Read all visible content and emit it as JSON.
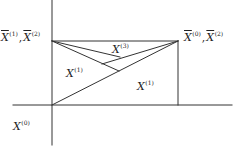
{
  "diagram": {
    "colors": {
      "line": "#333333",
      "text": "#222222",
      "background": "#ffffff"
    },
    "labels": {
      "top_left": {
        "a_base": "X",
        "a_sup": "(1)",
        "sep": ",",
        "b_base": "X",
        "b_sup": "(2)"
      },
      "top_right": {
        "a_base": "X",
        "a_sup": "(0)",
        "sep": ",",
        "b_base": "X",
        "b_sup": "(2)"
      },
      "region_top": {
        "base": "X",
        "sup": "(3)"
      },
      "region_left": {
        "base": "X",
        "sup": "(1)"
      },
      "region_right": {
        "base": "X",
        "sup": "(1)"
      },
      "bottom_left": {
        "base": "X",
        "sup": "(0)"
      }
    },
    "lines": {
      "vertical_axis": {
        "x1": 52,
        "y1": 0,
        "x2": 52,
        "y2": 145
      },
      "horizontal_axis": {
        "x1": 13,
        "y1": 105,
        "x2": 232,
        "y2": 105
      },
      "top_edge": {
        "x1": 52,
        "y1": 41,
        "x2": 178,
        "y2": 41
      },
      "right_edge": {
        "x1": 178,
        "y1": 41,
        "x2": 178,
        "y2": 105
      },
      "main_diagonal": {
        "x1": 178,
        "y1": 41,
        "x2": 52,
        "y2": 105
      },
      "upper_ray_left": {
        "x1": 52,
        "y1": 41,
        "x2": 120,
        "y2": 57
      },
      "lower_ray_left": {
        "x1": 52,
        "y1": 41,
        "x2": 119,
        "y2": 71
      },
      "ray_right": {
        "x1": 178,
        "y1": 41,
        "x2": 102,
        "y2": 64
      }
    }
  }
}
